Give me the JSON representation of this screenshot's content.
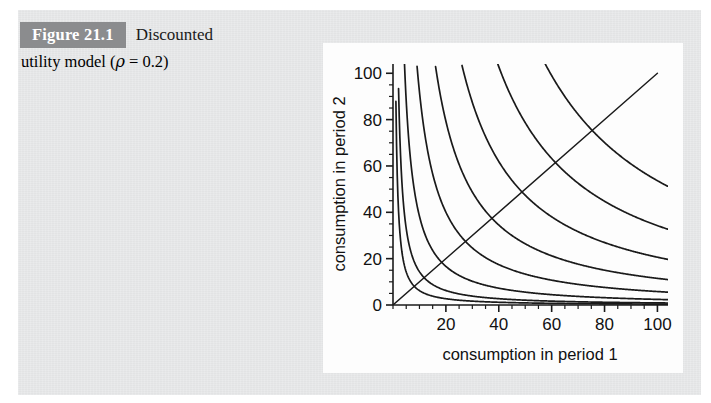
{
  "figure": {
    "badge_label": "Figure 21.1",
    "caption_part1": "Discounted",
    "caption_part2_prefix": "utility model (",
    "caption_rho": "ρ",
    "caption_equals": " = 0.2)",
    "badge_bg": "#8b8c8e",
    "badge_fg": "#ffffff",
    "page_bg": "#e8e9ea",
    "card_bg": "#fdfdfd"
  },
  "chart_data": {
    "type": "line",
    "title": "",
    "xlabel": "consumption in period 1",
    "ylabel": "consumption in period 2",
    "xlim": [
      0,
      104
    ],
    "ylim": [
      0,
      104
    ],
    "xticks": [
      20,
      40,
      60,
      80,
      100
    ],
    "xtick_labels": [
      "20",
      "40",
      "60",
      "80",
      "100"
    ],
    "yticks": [
      0,
      20,
      40,
      60,
      80,
      100
    ],
    "ytick_labels": [
      "0",
      "20",
      "40",
      "60",
      "80",
      "100"
    ],
    "minor_tick_step": 5,
    "grid": false,
    "legend": "none",
    "line_color": "#1a1a1a",
    "axis_color": "#1a1a1a",
    "model": "u(c1) + (1/(1+rho)) * u(c2) = k,  u(c)=ln(c),  rho=0.2",
    "rho": 0.2,
    "discount_factor": 0.8333,
    "series": [
      {
        "name": "indifference-curve-1",
        "k": 55,
        "values_x": [
          1,
          2,
          5,
          10,
          20,
          30,
          40,
          50,
          60,
          70,
          80,
          90,
          100
        ],
        "values_y": [
          98.5,
          42,
          10.5,
          3.6,
          1.2,
          0.7,
          0.45,
          0.33,
          0.25,
          0.21,
          0.17,
          0.15,
          0.13
        ]
      },
      {
        "name": "indifference-curve-2",
        "k": 240,
        "values_x": [
          2,
          3,
          5,
          10,
          20,
          30,
          40,
          50,
          60,
          70,
          80,
          90,
          100
        ],
        "values_y": [
          99,
          60,
          27,
          9.8,
          3.4,
          1.9,
          1.3,
          1.0,
          0.8,
          0.65,
          0.56,
          0.49,
          0.44
        ]
      },
      {
        "name": "indifference-curve-3",
        "k": 900,
        "values_x": [
          5,
          8,
          12,
          20,
          30,
          40,
          50,
          60,
          70,
          80,
          90,
          100
        ],
        "values_y": [
          88,
          47,
          26,
          12.6,
          6.8,
          4.5,
          3.3,
          2.6,
          2.1,
          1.8,
          1.5,
          1.35
        ]
      },
      {
        "name": "indifference-curve-4",
        "k": 2600,
        "values_x": [
          10,
          15,
          20,
          30,
          40,
          50,
          60,
          70,
          80,
          90,
          100
        ],
        "values_y": [
          92,
          52,
          35,
          19,
          12.6,
          9.2,
          7.2,
          5.8,
          4.9,
          4.2,
          3.7
        ]
      },
      {
        "name": "indifference-curve-5",
        "k": 5600,
        "values_x": [
          18,
          25,
          35,
          50,
          60,
          70,
          80,
          90,
          100
        ],
        "values_y": [
          90,
          55,
          33,
          19,
          15,
          12,
          10,
          8.6,
          7.5
        ]
      },
      {
        "name": "indifference-curve-6",
        "k": 11000,
        "values_x": [
          28,
          35,
          50,
          60,
          70,
          80,
          90,
          100
        ],
        "values_y": [
          95,
          68,
          40,
          31,
          25,
          21,
          18,
          16
        ]
      },
      {
        "name": "indifference-curve-7",
        "k": 22000,
        "values_x": [
          42,
          50,
          60,
          70,
          80,
          90,
          100
        ],
        "values_y": [
          97,
          78,
          57,
          44,
          35,
          29,
          25
        ]
      },
      {
        "name": "indifference-curve-8",
        "k": 42000,
        "values_x": [
          60,
          70,
          80,
          90,
          100
        ],
        "values_y": [
          99,
          80,
          65,
          54,
          46
        ]
      },
      {
        "name": "forty-five-degree-line",
        "k": null,
        "values_x": [
          0,
          100
        ],
        "values_y": [
          0,
          100
        ]
      }
    ]
  }
}
